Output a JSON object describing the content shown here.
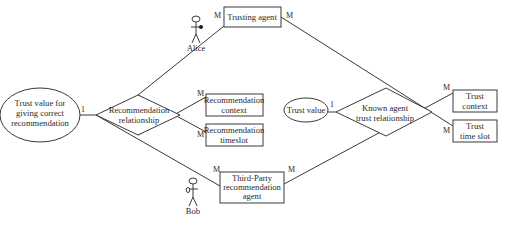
{
  "diagram": {
    "type": "entity-relationship",
    "actors": {
      "alice": {
        "label": "Alice"
      },
      "bob": {
        "label": "Bob"
      }
    },
    "entities": {
      "trusting_agent": {
        "label": "Trusting agent"
      },
      "rec_context": {
        "line1": "Recommendation",
        "line2": "context"
      },
      "rec_timeslot": {
        "line1": "Recommendation",
        "line2": "timeslot"
      },
      "third_party": {
        "line1": "Third-Party",
        "line2": "recommendation",
        "line3": "agent"
      },
      "trust_context": {
        "line1": "Trust",
        "line2": "context"
      },
      "trust_timeslot": {
        "line1": "Trust",
        "line2": "time slot"
      }
    },
    "attributes": {
      "trust_value_rec": {
        "line1": "Trust value for",
        "line2": "giving correct",
        "line3": "recommendation"
      },
      "trust_value": {
        "label": "Trust value"
      }
    },
    "relationships": {
      "recommendation": {
        "line1": "Recommendation",
        "line2": "relationship"
      },
      "known_agent": {
        "line1": "Known agent",
        "line2": "trust relationship"
      }
    },
    "cardinalities": {
      "trusting_agent_left": "M",
      "trusting_agent_right": "M",
      "trust_value_rec": "1",
      "rec_context": "M",
      "rec_timeslot": "M",
      "third_party_left": "M",
      "third_party_right": "M",
      "trust_value": "1",
      "trust_context": "M",
      "trust_timeslot": "M"
    }
  }
}
